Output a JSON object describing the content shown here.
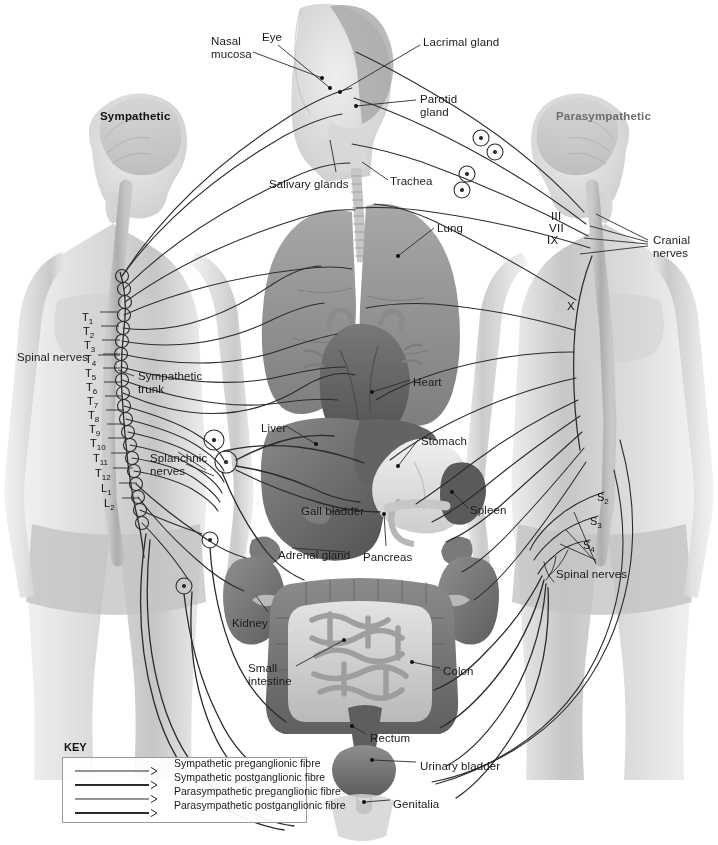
{
  "figure": {
    "headings": {
      "left": "Sympathetic",
      "right": "Parasympathetic"
    }
  },
  "colors": {
    "line": "#2b2b2b",
    "body": "#d9d9d9",
    "body_dark": "#bdbdbd",
    "cord": "#b0b0b0",
    "organ_dark": "#6f6f6f",
    "organ_mid": "#8d8d8d",
    "organ_light": "#cfcfcf",
    "text": "#1a1a1a",
    "heading_para": "#6e6e6e",
    "key_border": "#9a9a9a"
  },
  "organ_labels": [
    {
      "id": "nasal-mucosa",
      "text": "Nasal\nmucosa",
      "x": 211,
      "y": 35
    },
    {
      "id": "eye",
      "text": "Eye",
      "x": 262,
      "y": 31
    },
    {
      "id": "lacrimal-gland",
      "text": "Lacrimal gland",
      "x": 423,
      "y": 36
    },
    {
      "id": "parotid-gland",
      "text": "Parotid\ngland",
      "x": 420,
      "y": 93
    },
    {
      "id": "salivary-glands",
      "text": "Salivary glands",
      "x": 269,
      "y": 178
    },
    {
      "id": "trachea",
      "text": "Trachea",
      "x": 390,
      "y": 175
    },
    {
      "id": "lung",
      "text": "Lung",
      "x": 437,
      "y": 222
    },
    {
      "id": "heart",
      "text": "Heart",
      "x": 413,
      "y": 376
    },
    {
      "id": "liver",
      "text": "Liver",
      "x": 261,
      "y": 422
    },
    {
      "id": "stomach",
      "text": "Stomach",
      "x": 421,
      "y": 435
    },
    {
      "id": "gall-bladder",
      "text": "Gall bladder",
      "x": 301,
      "y": 505
    },
    {
      "id": "spleen",
      "text": "Spleen",
      "x": 470,
      "y": 504
    },
    {
      "id": "adrenal-gland",
      "text": "Adrenal gland",
      "x": 278,
      "y": 549
    },
    {
      "id": "pancreas",
      "text": "Pancreas",
      "x": 363,
      "y": 551
    },
    {
      "id": "kidney",
      "text": "Kidney",
      "x": 232,
      "y": 617
    },
    {
      "id": "small-intestine",
      "text": "Small\nintestine",
      "x": 248,
      "y": 662
    },
    {
      "id": "colon",
      "text": "Colon",
      "x": 443,
      "y": 665
    },
    {
      "id": "rectum",
      "text": "Rectum",
      "x": 370,
      "y": 732
    },
    {
      "id": "urinary-bladder",
      "text": "Urinary bladder",
      "x": 420,
      "y": 760
    },
    {
      "id": "genitalia",
      "text": "Genitalia",
      "x": 393,
      "y": 798
    }
  ],
  "left_labels": [
    {
      "id": "spinal-nerves-left",
      "text": "Spinal nerves",
      "x": 17,
      "y": 351
    },
    {
      "id": "sympathetic-trunk",
      "text": "Sympathetic\ntrunk",
      "x": 138,
      "y": 370
    },
    {
      "id": "splanchnic-nerves",
      "text": "Splanchnic\nnerves",
      "x": 150,
      "y": 452
    }
  ],
  "right_labels": [
    {
      "id": "cranial-nerves",
      "text": "Cranial\nnerves",
      "x": 653,
      "y": 234
    },
    {
      "id": "spinal-nerves-right",
      "text": "Spinal nerves",
      "x": 556,
      "y": 568
    }
  ],
  "cranial_nerves": [
    {
      "id": "cn-III",
      "text": "III",
      "x": 551,
      "y": 210
    },
    {
      "id": "cn-VII",
      "text": "VII",
      "x": 549,
      "y": 222
    },
    {
      "id": "cn-IX",
      "text": "IX",
      "x": 547,
      "y": 234
    },
    {
      "id": "cn-X",
      "text": "X",
      "x": 567,
      "y": 300
    }
  ],
  "spinal_segments_left": [
    {
      "id": "T1",
      "root": "T",
      "sub": "1",
      "x": 82,
      "y": 311
    },
    {
      "id": "T2",
      "root": "T",
      "sub": "2",
      "x": 83,
      "y": 325
    },
    {
      "id": "T3",
      "root": "T",
      "sub": "3",
      "x": 84,
      "y": 339
    },
    {
      "id": "T4",
      "root": "T",
      "sub": "4",
      "x": 85,
      "y": 353
    },
    {
      "id": "T5",
      "root": "T",
      "sub": "5",
      "x": 85,
      "y": 367
    },
    {
      "id": "T6",
      "root": "T",
      "sub": "6",
      "x": 86,
      "y": 381
    },
    {
      "id": "T7",
      "root": "T",
      "sub": "7",
      "x": 87,
      "y": 395
    },
    {
      "id": "T8",
      "root": "T",
      "sub": "8",
      "x": 88,
      "y": 409
    },
    {
      "id": "T9",
      "root": "T",
      "sub": "9",
      "x": 89,
      "y": 423
    },
    {
      "id": "T10",
      "root": "T",
      "sub": "10",
      "x": 90,
      "y": 437
    },
    {
      "id": "T11",
      "root": "T",
      "sub": "11",
      "x": 93,
      "y": 452
    },
    {
      "id": "T12",
      "root": "T",
      "sub": "12",
      "x": 95,
      "y": 467
    },
    {
      "id": "L1",
      "root": "L",
      "sub": "1",
      "x": 101,
      "y": 482
    },
    {
      "id": "L2",
      "root": "L",
      "sub": "2",
      "x": 104,
      "y": 497
    }
  ],
  "spinal_segments_right": [
    {
      "id": "S2",
      "root": "S",
      "sub": "2",
      "x": 597,
      "y": 491
    },
    {
      "id": "S3",
      "root": "S",
      "sub": "3",
      "x": 590,
      "y": 515
    },
    {
      "id": "S4",
      "root": "S",
      "sub": "4",
      "x": 583,
      "y": 539
    }
  ],
  "key": {
    "title": "KEY",
    "rows": [
      {
        "id": "sym-pre",
        "label": "Sympathetic preganglionic fibre",
        "weight": 1.2
      },
      {
        "id": "sym-post",
        "label": "Sympathetic postganglionic fibre",
        "weight": 2.1
      },
      {
        "id": "para-pre",
        "label": "Parasympathetic preganglionic fibre",
        "weight": 1.0
      },
      {
        "id": "para-post",
        "label": "Parasympathetic postganglionic fibre",
        "weight": 2.1
      }
    ]
  }
}
